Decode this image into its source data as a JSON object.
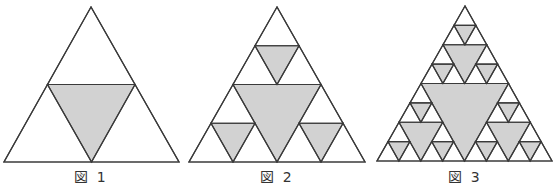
{
  "colors": {
    "stroke": "#3a3a3a",
    "fill": "#d2d2d2",
    "background": "#ffffff"
  },
  "figures": [
    {
      "label": "図 1",
      "level": 1,
      "apex": [
        91,
        7
      ],
      "base_left": [
        4,
        162
      ],
      "base_right": [
        179,
        162
      ],
      "label_x": 91
    },
    {
      "label": "図 2",
      "level": 2,
      "apex": [
        277,
        7
      ],
      "base_left": [
        189,
        162
      ],
      "base_right": [
        365,
        162
      ],
      "label_x": 277
    },
    {
      "label": "図 3",
      "level": 3,
      "apex": [
        465,
        6
      ],
      "base_left": [
        377,
        161
      ],
      "base_right": [
        552,
        161
      ],
      "label_x": 465
    }
  ]
}
